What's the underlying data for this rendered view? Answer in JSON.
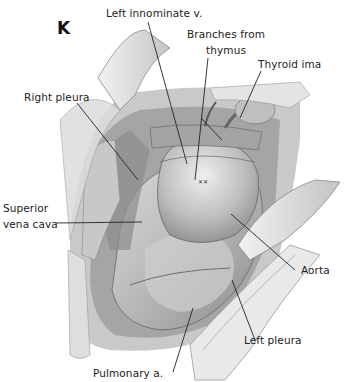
{
  "figure": {
    "panel_letter": "K",
    "labels": {
      "left_innominate": "Left innominate v.",
      "branches_from_thymus_1": "Branches from",
      "branches_from_thymus_2": "thymus",
      "thyroid_ima": "Thyroid ima",
      "right_pleura": "Right pleura",
      "superior_vena_cava_1": "Superior",
      "superior_vena_cava_2": "vena cava",
      "aorta": "Aorta",
      "left_pleura": "Left pleura",
      "pulmonary_artery": "Pulmonary a."
    },
    "colors": {
      "ink": "#222222",
      "tissue_dark": "#6e6e6e",
      "tissue_mid": "#a9a9a9",
      "tissue_light": "#d8d8d8",
      "retractor": "#e6e6e6"
    }
  }
}
